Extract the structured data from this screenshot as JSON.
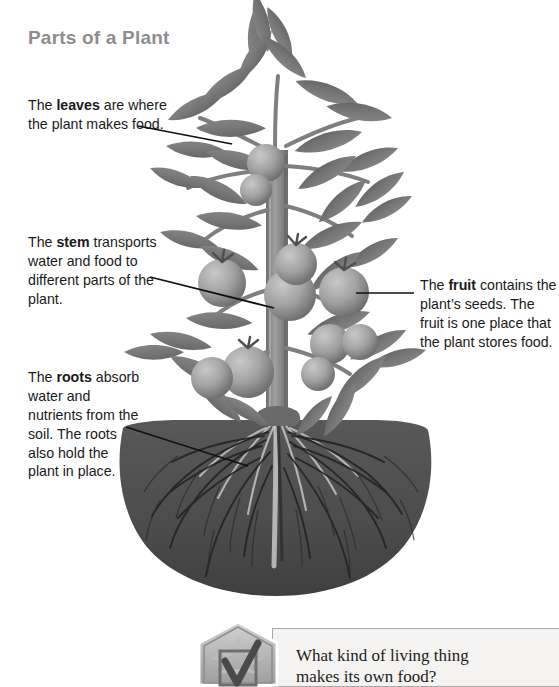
{
  "page": {
    "title": "Parts of a Plant",
    "title_color": "#8d8d8d",
    "background": "#ffffff"
  },
  "callouts": [
    {
      "id": "leaves",
      "name": "callout-leaves",
      "prefix": "The ",
      "term": "leaves",
      "suffix": " are where the plant makes food.",
      "full_text": "The leaves are where the plant makes food."
    },
    {
      "id": "stem",
      "name": "callout-stem",
      "prefix": "The ",
      "term": "stem",
      "suffix": " transports water and food to different parts of the plant.",
      "full_text": "The stem transports water and food to different parts of the plant."
    },
    {
      "id": "roots",
      "name": "callout-roots",
      "prefix": "The ",
      "term": "roots",
      "suffix": " absorb water and nutrients from the soil. The roots also hold the plant in place.",
      "full_text": "The roots absorb water and nutrients from the soil. The roots also hold the plant in place."
    },
    {
      "id": "fruit",
      "name": "callout-fruit",
      "prefix": "The ",
      "term": "fruit",
      "suffix": " contains the plant’s seeds. The fruit is one place that the plant stores food.",
      "full_text": "The fruit contains the plant’s seeds. The fruit is one place that the plant stores food."
    }
  ],
  "illustration": {
    "subject": "tomato plant with leaves, stem, fruit and roots in soil",
    "style": "grayscale photograph",
    "soil_color": "#4e4e4e",
    "foliage_color": "#7b7b7b",
    "fruit_color": "#9a9a9a",
    "stem_color": "#8a8a8a"
  },
  "question_panel": {
    "icon": "checkmark-badge-icon",
    "question": "What kind of living thing makes its own food?",
    "line1": "What kind of living thing",
    "line2": "makes its own food?",
    "border_color": "#a8a8a8",
    "background": "#f4f3f1"
  }
}
